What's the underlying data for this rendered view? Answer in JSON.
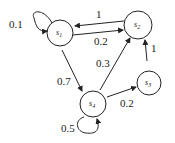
{
  "diagram": {
    "type": "markov-chain",
    "nodes": [
      {
        "id": "s1",
        "label": "s",
        "sub": "1"
      },
      {
        "id": "s2",
        "label": "s",
        "sub": "2"
      },
      {
        "id": "s3",
        "label": "s",
        "sub": "3"
      },
      {
        "id": "s4",
        "label": "s",
        "sub": "4"
      }
    ],
    "edges": [
      {
        "from": "s1",
        "to": "s1",
        "label": "0.1"
      },
      {
        "from": "s2",
        "to": "s1",
        "label": "1"
      },
      {
        "from": "s1",
        "to": "s2",
        "label": "0.2"
      },
      {
        "from": "s1",
        "to": "s4",
        "label": "0.7"
      },
      {
        "from": "s4",
        "to": "s2",
        "label": "0.3"
      },
      {
        "from": "s3",
        "to": "s2",
        "label": "1"
      },
      {
        "from": "s4",
        "to": "s3",
        "label": "0.2"
      },
      {
        "from": "s4",
        "to": "s4",
        "label": "0.5"
      }
    ]
  }
}
